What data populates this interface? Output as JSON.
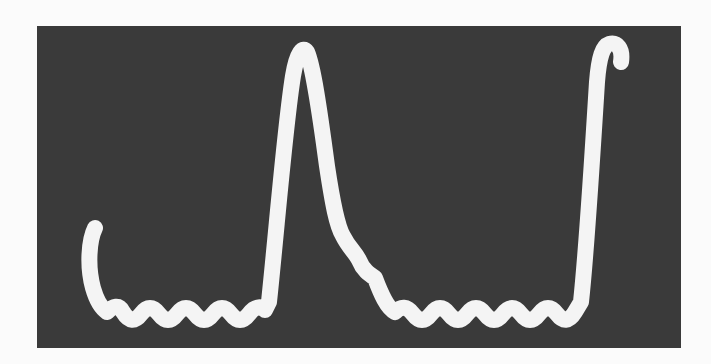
{
  "image": {
    "description": "Oscilloscope photograph showing a white waveform trace on a dark screen: a flat scalloped baseline with two sharp peaks",
    "background_color": "#fbfbfb",
    "screen_color": "#3a3a3a",
    "trace_color": "#f4f4f4"
  },
  "waveform": {
    "features": [
      "left hook rising at start",
      "scalloped baseline with 7 lobes",
      "sharp peak near center",
      "descending shoulder with ripples",
      "scalloped baseline with 9 lobes",
      "sharp peak at right edge with small hook"
    ]
  }
}
